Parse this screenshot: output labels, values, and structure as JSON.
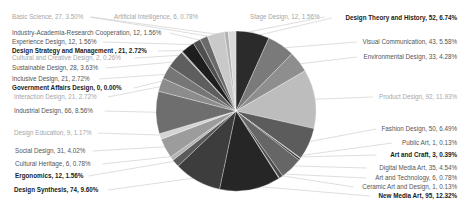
{
  "chart_data": {
    "type": "pie",
    "title": "",
    "start_angle_deg": 0,
    "direction": "clockwise",
    "center": [
      236,
      111
    ],
    "radius": 80,
    "legend": "none (labels with leader lines)",
    "slices": [
      {
        "label": "Design Theory and History",
        "value": 52,
        "percent": "6.74%",
        "color": "#2b2b2b",
        "style": "bold",
        "lx": 457,
        "ly": 20,
        "anchor": "end"
      },
      {
        "label": "Visual Communication",
        "value": 43,
        "percent": "5.58%",
        "color": "#7a7a7a",
        "style": "normal",
        "lx": 457,
        "ly": 44,
        "anchor": "end"
      },
      {
        "label": "Environmental Design",
        "value": 33,
        "percent": "4.28%",
        "color": "#8e8e8e",
        "style": "normal",
        "lx": 457,
        "ly": 59,
        "anchor": "end"
      },
      {
        "label": "Product Design",
        "value": 92,
        "percent": "11.93%",
        "color": "#bdbdbd",
        "style": "faint",
        "lx": 457,
        "ly": 99,
        "anchor": "end"
      },
      {
        "label": "Fashion Design",
        "value": 50,
        "percent": "6.49%",
        "color": "#5c5c5c",
        "style": "normal",
        "lx": 457,
        "ly": 131,
        "anchor": "end"
      },
      {
        "label": "Public Art",
        "value": 1,
        "percent": "0.13%",
        "color": "#9a9a9a",
        "style": "normal",
        "lx": 457,
        "ly": 145,
        "anchor": "end"
      },
      {
        "label": "Art and Craft",
        "value": 3,
        "percent": "0.39%",
        "color": "#3a3a3a",
        "style": "bold",
        "lx": 457,
        "ly": 157,
        "anchor": "end"
      },
      {
        "label": "Digital Media Art",
        "value": 35,
        "percent": "4.54%",
        "color": "#666666",
        "style": "normal",
        "lx": 457,
        "ly": 170,
        "anchor": "end"
      },
      {
        "label": "Art and Technology",
        "value": 6,
        "percent": "0.78%",
        "color": "#4a4a4a",
        "style": "normal",
        "lx": 457,
        "ly": 180,
        "anchor": "end"
      },
      {
        "label": "Ceramic Art and Design",
        "value": 1,
        "percent": "0.13%",
        "color": "#8a8a8a",
        "style": "normal",
        "lx": 457,
        "ly": 189,
        "anchor": "end"
      },
      {
        "label": "New Media Art",
        "value": 95,
        "percent": "12.32%",
        "color": "#262626",
        "style": "bold",
        "lx": 457,
        "ly": 198,
        "anchor": "end"
      },
      {
        "label": "Design Synthesis",
        "value": 74,
        "percent": "9.60%",
        "color": "#3d3d3d",
        "style": "bold",
        "lx": 14,
        "ly": 192,
        "anchor": "start"
      },
      {
        "label": "Ergonomics",
        "value": 12,
        "percent": "1.56%",
        "color": "#5a5a5a",
        "style": "bold",
        "lx": 15,
        "ly": 178,
        "anchor": "start"
      },
      {
        "label": "Cultural Heritage",
        "value": 6,
        "percent": "0.78%",
        "color": "#b3b3b3",
        "style": "normal",
        "lx": 15,
        "ly": 166,
        "anchor": "start"
      },
      {
        "label": "Social Design",
        "value": 31,
        "percent": "4.02%",
        "color": "#9c9c9c",
        "style": "normal",
        "lx": 15,
        "ly": 153,
        "anchor": "start"
      },
      {
        "label": "Design Education",
        "value": 9,
        "percent": "1.17%",
        "color": "#d4d4d4",
        "style": "faint",
        "lx": 14,
        "ly": 135,
        "anchor": "start"
      },
      {
        "label": "Industrial Design",
        "value": 66,
        "percent": "8.56%",
        "color": "#6e6e6e",
        "style": "normal",
        "lx": 14,
        "ly": 113,
        "anchor": "start"
      },
      {
        "label": "Interaction Design",
        "value": 21,
        "percent": "2.72%",
        "color": "#8c8c8c",
        "style": "faint",
        "lx": 14,
        "ly": 99,
        "anchor": "start"
      },
      {
        "label": "Government Affairs Design",
        "value": 0,
        "percent": "0.00%",
        "color": "#000000",
        "style": "bold",
        "lx": 12,
        "ly": 90,
        "anchor": "start"
      },
      {
        "label": "Inclusive Design",
        "value": 21,
        "percent": "2.72%",
        "color": "#767676",
        "style": "normal",
        "lx": 12,
        "ly": 81,
        "anchor": "start"
      },
      {
        "label": "Sustainable Design",
        "value": 28,
        "percent": "3.63%",
        "color": "#5e5e5e",
        "style": "normal",
        "lx": 12,
        "ly": 70,
        "anchor": "start"
      },
      {
        "label": "Cultural and Creative Design",
        "value": 2,
        "percent": "0.26%",
        "color": "#a8a8a8",
        "style": "faint",
        "lx": 12,
        "ly": 60,
        "anchor": "start"
      },
      {
        "label": "Design Strategy and Management ",
        "value": 21,
        "percent": "2.72%",
        "color": "#1e1e1e",
        "style": "bold",
        "lx": 12,
        "ly": 53,
        "anchor": "start"
      },
      {
        "label": "Experience Design",
        "value": 12,
        "percent": "1.56%",
        "color": "#4f4f4f",
        "style": "normal",
        "lx": 12,
        "ly": 44,
        "anchor": "start"
      },
      {
        "label": "Industry-Academia-Research Cooperation",
        "value": 12,
        "percent": "1.56%",
        "color": "#6a6a6a",
        "style": "normal",
        "lx": 12,
        "ly": 35,
        "anchor": "start"
      },
      {
        "label": "Basic Science",
        "value": 27,
        "percent": "3.50%",
        "color": "#c9c9c9",
        "style": "faint",
        "lx": 12,
        "ly": 19,
        "anchor": "start"
      },
      {
        "label": "Artificial Intelligence",
        "value": 6,
        "percent": "0.78%",
        "color": "#b0b0b0",
        "style": "faint",
        "lx": 198,
        "ly": 19,
        "anchor": "end"
      },
      {
        "label": "Stage Design",
        "value": 12,
        "percent": "1.56%",
        "color": "#dadada",
        "style": "faint",
        "lx": 250,
        "ly": 19,
        "anchor": "start"
      }
    ],
    "total": 771
  }
}
